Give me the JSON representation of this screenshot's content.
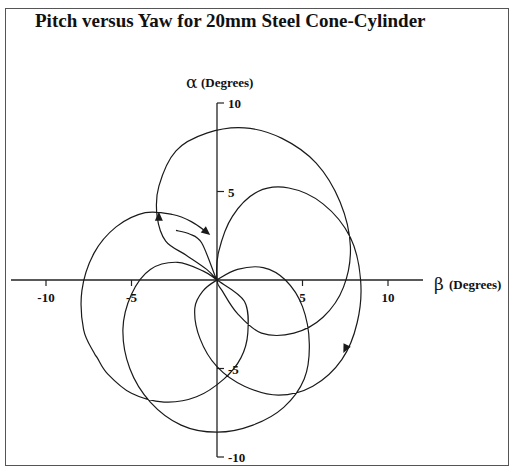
{
  "chart_data": {
    "type": "line",
    "title": "Pitch versus Yaw for 20mm Steel Cone-Cylinder",
    "xlabel_symbol": "β",
    "xlabel": "(Degrees)",
    "ylabel_symbol": "α",
    "ylabel": "(Degrees)",
    "xlim": [
      -10,
      10
    ],
    "ylim": [
      -10,
      10
    ],
    "xticks": [
      -10,
      -5,
      5,
      10
    ],
    "xtick_labels": [
      "-10",
      "-5",
      "5",
      "10"
    ],
    "yticks": [
      10,
      5,
      -5,
      -10
    ],
    "ytick_labels": [
      "10",
      "5",
      "-5",
      "-10"
    ],
    "grid": false,
    "legend": "none",
    "series": [
      {
        "name": "pitch-yaw trace",
        "points": [
          [
            -2.4,
            2.8
          ],
          [
            -1.6,
            2.6
          ],
          [
            -0.9,
            2.1
          ],
          [
            -0.1,
            0.2
          ],
          [
            0,
            0
          ],
          [
            -0.6,
            0.6
          ],
          [
            -1.8,
            1.4
          ],
          [
            -3.0,
            2.2
          ],
          [
            -3.5,
            3.6
          ],
          [
            -3.4,
            5.3
          ],
          [
            -2.4,
            7.3
          ],
          [
            -0.6,
            8.3
          ],
          [
            1.6,
            8.6
          ],
          [
            3.8,
            8.0
          ],
          [
            5.8,
            6.6
          ],
          [
            7.2,
            4.4
          ],
          [
            7.8,
            1.9
          ],
          [
            7.4,
            -0.4
          ],
          [
            6.2,
            -2.1
          ],
          [
            4.5,
            -3.0
          ],
          [
            2.6,
            -3.0
          ],
          [
            1.2,
            -1.9
          ],
          [
            0.3,
            -0.6
          ],
          [
            0,
            0
          ],
          [
            0.1,
            1.6
          ],
          [
            0.9,
            3.6
          ],
          [
            2.4,
            5.0
          ],
          [
            4.2,
            5.2
          ],
          [
            6.2,
            4.3
          ],
          [
            7.8,
            2.4
          ],
          [
            8.4,
            0.0
          ],
          [
            8.2,
            -2.4
          ],
          [
            7.3,
            -4.5
          ],
          [
            5.6,
            -6.0
          ],
          [
            3.6,
            -6.5
          ],
          [
            1.6,
            -6.0
          ],
          [
            0.0,
            -4.9
          ],
          [
            -1.0,
            -3.3
          ],
          [
            -1.3,
            -1.6
          ],
          [
            -0.8,
            -0.6
          ],
          [
            0,
            0
          ],
          [
            1.2,
            0.6
          ],
          [
            2.7,
            0.7
          ],
          [
            4.0,
            0.0
          ],
          [
            5.0,
            -1.5
          ],
          [
            5.4,
            -3.6
          ],
          [
            5.1,
            -5.6
          ],
          [
            3.9,
            -7.2
          ],
          [
            2.1,
            -8.2
          ],
          [
            0.0,
            -8.6
          ],
          [
            -2.1,
            -8.2
          ],
          [
            -3.9,
            -6.9
          ],
          [
            -5.1,
            -5.0
          ],
          [
            -5.5,
            -2.8
          ],
          [
            -5.0,
            -0.8
          ],
          [
            -3.9,
            0.6
          ],
          [
            -2.3,
            1.0
          ],
          [
            -0.8,
            0.5
          ],
          [
            0,
            0
          ],
          [
            1.6,
            -1.2
          ],
          [
            1.8,
            -3.0
          ],
          [
            1.4,
            -4.4
          ],
          [
            0.4,
            -5.6
          ],
          [
            -1.2,
            -6.6
          ],
          [
            -3.1,
            -6.9
          ],
          [
            -5.0,
            -6.4
          ],
          [
            -6.4,
            -5.3
          ],
          [
            -7.0,
            -4.4
          ],
          [
            -7.2,
            -4.1
          ],
          [
            -7.8,
            -2.8
          ],
          [
            -7.9,
            -0.6
          ],
          [
            -7.2,
            1.5
          ],
          [
            -5.9,
            3.0
          ],
          [
            -4.2,
            3.8
          ],
          [
            -2.6,
            3.7
          ],
          [
            -1.5,
            3.3
          ],
          [
            -0.6,
            2.7
          ]
        ],
        "arrows": [
          {
            "at": [
              -3.4,
              3.6
            ],
            "direction": "up"
          },
          {
            "at": [
              -0.6,
              2.7
            ],
            "direction": "down-right"
          },
          {
            "at": [
              7.5,
              -3.9
            ],
            "direction": "down-left"
          }
        ]
      }
    ]
  }
}
